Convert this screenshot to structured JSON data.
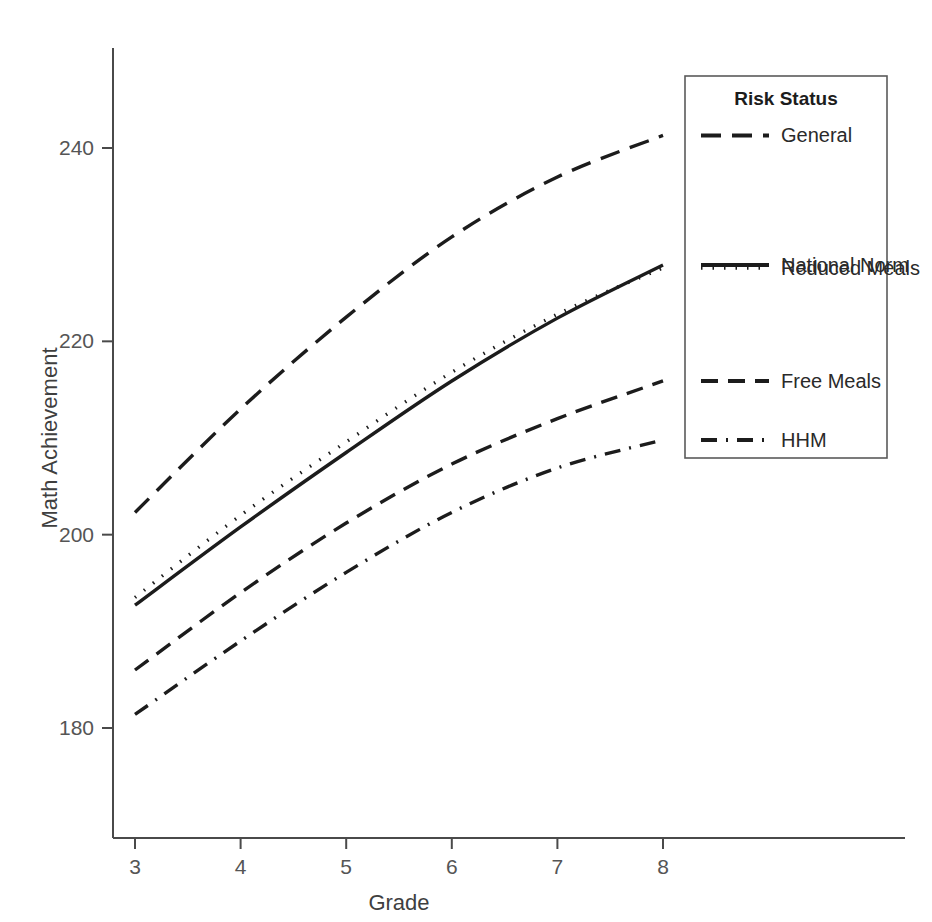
{
  "chart_data": {
    "type": "line",
    "title": "",
    "xlabel": "Grade",
    "ylabel": "Math Achievement",
    "legend_title": "Risk Status",
    "legend_position": "right",
    "grid": false,
    "x": [
      3,
      4,
      5,
      6,
      7,
      8
    ],
    "xlim": [
      2.8,
      8.2
    ],
    "ylim": [
      176,
      246
    ],
    "xticks": [
      "3",
      "4",
      "5",
      "6",
      "7",
      "8"
    ],
    "yticks": [
      "180",
      "200",
      "220",
      "240"
    ],
    "ytick_values": [
      180,
      200,
      220,
      240
    ],
    "series": [
      {
        "name": "General",
        "style": "long-dash",
        "values": [
          202.3,
          213.0,
          222.5,
          230.8,
          237.0,
          241.3
        ]
      },
      {
        "name": "National Norm",
        "style": "solid",
        "values": [
          192.7,
          200.8,
          208.5,
          215.9,
          222.4,
          227.9
        ]
      },
      {
        "name": "Reduced Meals",
        "style": "dotted",
        "values": [
          193.5,
          202.0,
          209.6,
          216.8,
          222.8,
          227.6
        ]
      },
      {
        "name": "Free Meals",
        "style": "dash",
        "values": [
          186.0,
          194.0,
          201.2,
          207.3,
          212.0,
          215.9
        ]
      },
      {
        "name": "HHM",
        "style": "dash-dot",
        "values": [
          181.4,
          189.0,
          196.1,
          202.3,
          206.9,
          209.8
        ]
      }
    ]
  },
  "legend": {
    "title": "Risk Status",
    "entries": [
      {
        "label": "General",
        "style": "long-dash"
      },
      {
        "label": "National Norm",
        "style": "solid"
      },
      {
        "label": "Reduced Meals",
        "style": "dotted"
      },
      {
        "label": "Free Meals",
        "style": "dash"
      },
      {
        "label": "HHM",
        "style": "dash-dot"
      }
    ]
  },
  "axes": {
    "x_title": "Grade",
    "y_title": "Math Achievement"
  },
  "colors": {
    "ink": "#1c1c1c",
    "axis": "#4a4a4a",
    "label": "#555555",
    "background": "#ffffff"
  }
}
